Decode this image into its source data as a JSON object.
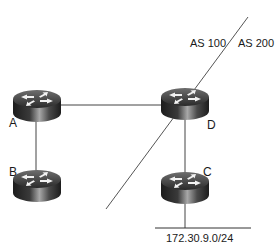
{
  "diagram": {
    "title": "",
    "routers": [
      {
        "id": "A",
        "label": "A"
      },
      {
        "id": "B",
        "label": "B"
      },
      {
        "id": "C",
        "label": "C"
      },
      {
        "id": "D",
        "label": "D"
      }
    ],
    "links": [
      {
        "from": "A",
        "to": "D"
      },
      {
        "from": "A",
        "to": "B"
      },
      {
        "from": "D",
        "to": "C"
      },
      {
        "from": "C",
        "to": "LAN"
      }
    ],
    "network": {
      "label": "172.30.9.0/24",
      "attached_to": "C"
    },
    "as_boundary": {
      "left_label": "AS 100",
      "right_label": "AS 200"
    },
    "colors": {
      "line": "#444444",
      "router_dark": "#1e1e1e",
      "router_light": "#9a9a9a",
      "arrow": "#f2f2f2"
    }
  }
}
